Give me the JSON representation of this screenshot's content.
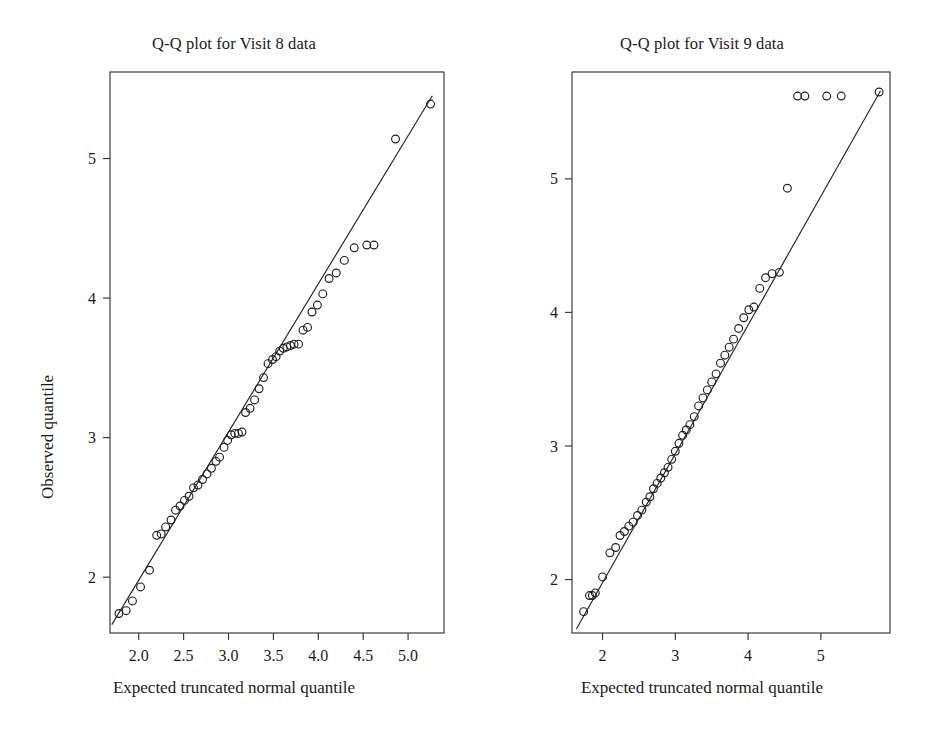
{
  "figure": {
    "width": 936,
    "height": 732,
    "background": "#ffffff",
    "marker_color": "#1f1f1f",
    "line_color": "#242424",
    "frame_color": "#3c3c3c"
  },
  "panels": [
    {
      "id": "left",
      "title": "Q-Q plot for Visit 8 data",
      "xlabel": "Expected truncated normal quantile",
      "ylabel": "Observed quantile"
    },
    {
      "id": "right",
      "title": "Q-Q plot for Visit 9 data",
      "xlabel": "Expected truncated normal quantile",
      "ylabel": "Observed quantile"
    }
  ],
  "chart_data": [
    {
      "type": "scatter",
      "title": "Q-Q plot for Visit 8 data",
      "xlabel": "Expected truncated normal quantile",
      "ylabel": "Observed quantile",
      "grid": false,
      "legend": "none",
      "xlim": [
        1.68,
        5.4
      ],
      "ylim": [
        1.6,
        5.62
      ],
      "xticks": [
        2.0,
        2.5,
        3.0,
        3.5,
        4.0,
        4.5,
        5.0
      ],
      "xticklabels": [
        "2.0",
        "2.5",
        "3.0",
        "3.5",
        "4.0",
        "4.5",
        "5.0"
      ],
      "yticks": [
        2,
        3,
        4,
        5
      ],
      "yticklabels": [
        "2",
        "3",
        "4",
        "5"
      ],
      "reference_line": {
        "x": [
          1.7,
          5.27
        ],
        "y": [
          1.66,
          5.45
        ]
      },
      "x": [
        1.78,
        1.86,
        1.93,
        2.02,
        2.12,
        2.2,
        2.25,
        2.3,
        2.36,
        2.41,
        2.46,
        2.51,
        2.56,
        2.61,
        2.66,
        2.71,
        2.76,
        2.81,
        2.86,
        2.9,
        2.95,
        2.99,
        3.03,
        3.07,
        3.11,
        3.15,
        3.19,
        3.24,
        3.29,
        3.34,
        3.39,
        3.44,
        3.49,
        3.53,
        3.57,
        3.61,
        3.65,
        3.69,
        3.73,
        3.78,
        3.83,
        3.88,
        3.93,
        3.99,
        4.05,
        4.12,
        4.2,
        4.29,
        4.4,
        4.54,
        4.62,
        4.86,
        5.25
      ],
      "y": [
        1.74,
        1.76,
        1.83,
        1.93,
        2.05,
        2.3,
        2.31,
        2.36,
        2.41,
        2.48,
        2.51,
        2.55,
        2.58,
        2.64,
        2.66,
        2.7,
        2.74,
        2.78,
        2.83,
        2.86,
        2.93,
        2.98,
        3.02,
        3.03,
        3.03,
        3.04,
        3.18,
        3.21,
        3.27,
        3.35,
        3.43,
        3.53,
        3.56,
        3.58,
        3.62,
        3.64,
        3.65,
        3.66,
        3.67,
        3.67,
        3.77,
        3.79,
        3.9,
        3.95,
        4.03,
        4.14,
        4.18,
        4.27,
        4.36,
        4.38,
        4.38,
        5.14,
        5.39
      ]
    },
    {
      "type": "scatter",
      "title": "Q-Q plot for Visit 9 data",
      "xlabel": "Expected truncated normal quantile",
      "ylabel": "Observed quantile",
      "grid": false,
      "legend": "none",
      "xlim": [
        1.58,
        5.95
      ],
      "ylim": [
        1.6,
        5.8
      ],
      "xticks": [
        2,
        3,
        4,
        5
      ],
      "xticklabels": [
        "2",
        "3",
        "4",
        "5"
      ],
      "yticks": [
        2,
        3,
        4,
        5
      ],
      "yticklabels": [
        "2",
        "3",
        "4",
        "5"
      ],
      "reference_line": {
        "x": [
          1.64,
          5.82
        ],
        "y": [
          1.63,
          5.66
        ]
      },
      "x": [
        1.74,
        1.82,
        1.86,
        1.9,
        2.0,
        2.1,
        2.18,
        2.24,
        2.3,
        2.36,
        2.42,
        2.48,
        2.54,
        2.6,
        2.65,
        2.7,
        2.75,
        2.8,
        2.85,
        2.9,
        2.95,
        3.0,
        3.05,
        3.1,
        3.15,
        3.2,
        3.26,
        3.32,
        3.38,
        3.44,
        3.5,
        3.56,
        3.62,
        3.68,
        3.74,
        3.8,
        3.87,
        3.94,
        4.01,
        4.08,
        4.16,
        4.24,
        4.33,
        4.43,
        4.54,
        4.68,
        4.78,
        5.08,
        5.28,
        5.8
      ],
      "y": [
        1.76,
        1.88,
        1.88,
        1.9,
        2.02,
        2.2,
        2.24,
        2.33,
        2.36,
        2.4,
        2.43,
        2.48,
        2.52,
        2.58,
        2.62,
        2.68,
        2.72,
        2.76,
        2.8,
        2.84,
        2.9,
        2.96,
        3.02,
        3.08,
        3.12,
        3.16,
        3.22,
        3.3,
        3.36,
        3.42,
        3.48,
        3.54,
        3.62,
        3.68,
        3.74,
        3.8,
        3.88,
        3.96,
        4.02,
        4.04,
        4.18,
        4.26,
        4.29,
        4.3,
        4.93,
        5.62,
        5.62,
        5.62,
        5.62,
        5.65
      ]
    }
  ]
}
